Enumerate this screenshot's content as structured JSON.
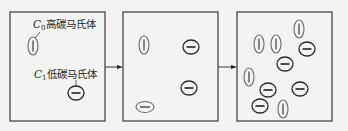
{
  "diagram": {
    "type": "process-sequence",
    "stroke_color": "#3a3a3a",
    "background": "#f3f3f1",
    "labels": {
      "c0": {
        "symbol": "C",
        "subscript": "0",
        "text": "高碳马氏体"
      },
      "c1": {
        "symbol": "C",
        "subscript": "1",
        "text": "低碳马氏体"
      }
    },
    "stages": [
      {
        "id": "stage-1",
        "box": {
          "x": 10,
          "y": 12,
          "w": 95,
          "h": 109
        },
        "particles": [
          {
            "kind": "high-carbon",
            "orientation": "vertical",
            "cx": 33,
            "cy": 46
          },
          {
            "kind": "low-carbon",
            "orientation": "horizontal",
            "cx": 76,
            "cy": 93
          }
        ]
      },
      {
        "id": "stage-2",
        "box": {
          "x": 123,
          "y": 12,
          "w": 95,
          "h": 109
        },
        "particles": [
          {
            "kind": "high-carbon",
            "orientation": "vertical",
            "cx": 144,
            "cy": 45
          },
          {
            "kind": "low-carbon",
            "orientation": "horizontal",
            "cx": 191,
            "cy": 47
          },
          {
            "kind": "low-carbon",
            "orientation": "horizontal",
            "cx": 189,
            "cy": 88
          },
          {
            "kind": "high-carbon-flat",
            "orientation": "horizontal",
            "cx": 145,
            "cy": 107
          }
        ]
      },
      {
        "id": "stage-3",
        "box": {
          "x": 237,
          "y": 12,
          "w": 95,
          "h": 109
        },
        "particles": [
          {
            "kind": "high-carbon",
            "orientation": "vertical",
            "cx": 299,
            "cy": 29
          },
          {
            "kind": "high-carbon",
            "orientation": "vertical",
            "cx": 259,
            "cy": 44
          },
          {
            "kind": "high-carbon",
            "orientation": "vertical",
            "cx": 276,
            "cy": 44
          },
          {
            "kind": "low-carbon",
            "orientation": "horizontal",
            "cx": 307,
            "cy": 49
          },
          {
            "kind": "low-carbon",
            "orientation": "horizontal",
            "cx": 285,
            "cy": 64
          },
          {
            "kind": "high-carbon",
            "orientation": "vertical",
            "cx": 249,
            "cy": 77
          },
          {
            "kind": "low-carbon",
            "orientation": "horizontal",
            "cx": 268,
            "cy": 90
          },
          {
            "kind": "low-carbon",
            "orientation": "horizontal",
            "cx": 300,
            "cy": 89
          },
          {
            "kind": "low-carbon",
            "orientation": "horizontal",
            "cx": 260,
            "cy": 106
          },
          {
            "kind": "high-carbon",
            "orientation": "vertical",
            "cx": 283,
            "cy": 109
          }
        ]
      }
    ],
    "arrows": [
      {
        "from": "stage-1",
        "to": "stage-2",
        "x1": 105,
        "x2": 123,
        "y": 67
      },
      {
        "from": "stage-2",
        "to": "stage-3",
        "x1": 218,
        "x2": 237,
        "y": 67
      }
    ]
  }
}
